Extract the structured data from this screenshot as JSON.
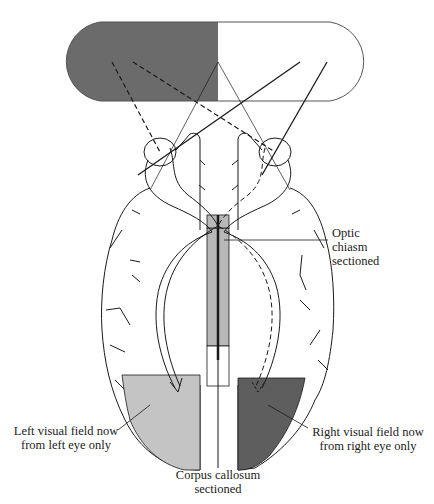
{
  "figure": {
    "type": "split-brain visual pathway diagram",
    "visual_field": {
      "left_half_color": "#6b6b6b",
      "right_half_color": "#ffffff"
    },
    "occipital_fields": {
      "left_color": "#c4c4c4",
      "right_color": "#5e5e5e"
    },
    "midline_color": "#b8b8b8",
    "stroke_color": "#1a1a1a"
  },
  "labels": {
    "optic_chiasm": {
      "line1": "Optic",
      "line2": "chiasm",
      "line3": "sectioned"
    },
    "left_field": {
      "line1": "Left visual field now",
      "line2": "from left eye only"
    },
    "right_field": {
      "line1": "Right visual field now",
      "line2": "from right eye only"
    },
    "corpus_callosum": {
      "line1": "Corpus callosum",
      "line2": "sectioned"
    }
  }
}
